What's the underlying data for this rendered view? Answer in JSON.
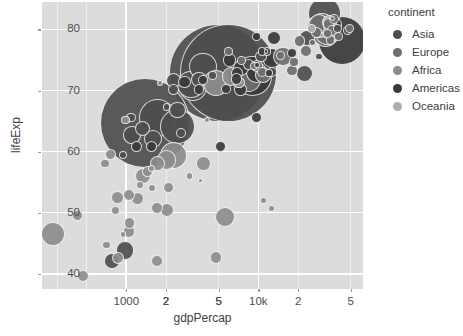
{
  "axes": {
    "xlabel": "gdpPercap",
    "ylabel": "lifeExp",
    "caption": "",
    "y_ticks": [
      "40",
      "50",
      "60",
      "70",
      "80"
    ],
    "x_ticks": [
      "2",
      "5",
      "1000",
      "2",
      "5",
      "10k",
      "2",
      "5"
    ]
  },
  "legend": {
    "title": "continent",
    "items": [
      {
        "label": "Asia",
        "color": "#4e4e4e"
      },
      {
        "label": "Europe",
        "color": "#6e6e6e"
      },
      {
        "label": "Africa",
        "color": "#8d8d8d"
      },
      {
        "label": "Americas",
        "color": "#3a3a3a"
      },
      {
        "label": "Oceania",
        "color": "#aeaeae"
      }
    ]
  },
  "chart_data": {
    "type": "scatter",
    "title": "",
    "xlabel": "gdpPercap",
    "ylabel": "lifeExp",
    "xscale": "log",
    "yscale": "linear",
    "xlim": [
      230,
      62000
    ],
    "ylim": [
      37.5,
      84.5
    ],
    "grid": true,
    "legend_position": "right",
    "legend_title": "continent",
    "size_encoding": "pop",
    "color_encoding": "continent",
    "x_tick_values": [
      2000,
      5000,
      1000,
      2000,
      5000,
      10000,
      20000,
      50000
    ],
    "x_tick_labels": [
      "2",
      "5",
      "1000",
      "2",
      "5",
      "10k",
      "2",
      "5"
    ],
    "y_tick_values": [
      40,
      50,
      60,
      70,
      80
    ],
    "y_tick_labels": [
      "40",
      "50",
      "60",
      "70",
      "80"
    ],
    "series": [
      {
        "name": "Asia",
        "color": "#4e4e4e",
        "points": [
          {
            "x": 974,
            "y": 43.8,
            "size": 31.9
          },
          {
            "x": 1391,
            "y": 64.7,
            "size": 1110.0
          },
          {
            "x": 4959,
            "y": 72.9,
            "size": 1318.7
          },
          {
            "x": 2452,
            "y": 64.1,
            "size": 150.4
          },
          {
            "x": 3541,
            "y": 71.8,
            "size": 22.2
          },
          {
            "x": 11606,
            "y": 76.4,
            "size": 4.0
          },
          {
            "x": 31656,
            "y": 82.6,
            "size": 127.5
          },
          {
            "x": 4519,
            "y": 72.5,
            "size": 4.0
          },
          {
            "x": 1593,
            "y": 62.1,
            "size": 31.9
          },
          {
            "x": 23348,
            "y": 78.6,
            "size": 23.0
          },
          {
            "x": 47307,
            "y": 79.9,
            "size": 4.6
          },
          {
            "x": 3095,
            "y": 71.0,
            "size": 88.0
          },
          {
            "x": 2441,
            "y": 66.8,
            "size": 24.0
          },
          {
            "x": 28718,
            "y": 75.6,
            "size": 2.5
          },
          {
            "x": 12779,
            "y": 73.0,
            "size": 6.4
          },
          {
            "x": 944,
            "y": 59.5,
            "size": 3.2
          },
          {
            "x": 1714,
            "y": 65.5,
            "size": 169.0
          },
          {
            "x": 3190,
            "y": 70.6,
            "size": 91.0
          },
          {
            "x": 1091,
            "y": 65.6,
            "size": 5.9
          },
          {
            "x": 22316,
            "y": 72.8,
            "size": 27.6
          },
          {
            "x": 2280,
            "y": 71.7,
            "size": 20.4
          },
          {
            "x": 1107,
            "y": 62.7,
            "size": 28.9
          },
          {
            "x": 2602,
            "y": 63.1,
            "size": 6.6
          },
          {
            "x": 39725,
            "y": 80.2,
            "size": 4.6
          },
          {
            "x": 2280,
            "y": 70.2,
            "size": 8.1
          },
          {
            "x": 5937,
            "y": 72.9,
            "size": 1318.0
          },
          {
            "x": 10461,
            "y": 75.6,
            "size": 9.0
          },
          {
            "x": 1327,
            "y": 63.8,
            "size": 20.0
          },
          {
            "x": 3822,
            "y": 73.9,
            "size": 85.3
          },
          {
            "x": 2013,
            "y": 67.3,
            "size": 2.1
          },
          {
            "x": 780,
            "y": 42.1,
            "size": 22.2
          },
          {
            "x": 8458,
            "y": 74.2,
            "size": 8.9
          }
        ]
      },
      {
        "name": "Europe",
        "color": "#6e6e6e",
        "points": [
          {
            "x": 5937,
            "y": 76.4,
            "size": 3.6
          },
          {
            "x": 36126,
            "y": 79.8,
            "size": 8.2
          },
          {
            "x": 33693,
            "y": 79.4,
            "size": 10.4
          },
          {
            "x": 7446,
            "y": 74.9,
            "size": 3.9
          },
          {
            "x": 10681,
            "y": 73.0,
            "size": 7.3
          },
          {
            "x": 14619,
            "y": 75.7,
            "size": 4.5
          },
          {
            "x": 22833,
            "y": 76.5,
            "size": 10.2
          },
          {
            "x": 35278,
            "y": 78.3,
            "size": 5.5
          },
          {
            "x": 33207,
            "y": 79.3,
            "size": 5.2
          },
          {
            "x": 30470,
            "y": 80.7,
            "size": 61.1
          },
          {
            "x": 32170,
            "y": 79.4,
            "size": 82.4
          },
          {
            "x": 27538,
            "y": 79.5,
            "size": 10.7
          },
          {
            "x": 18009,
            "y": 73.3,
            "size": 10.0
          },
          {
            "x": 36180,
            "y": 81.8,
            "size": 0.3
          },
          {
            "x": 40676,
            "y": 78.9,
            "size": 4.1
          },
          {
            "x": 28570,
            "y": 80.5,
            "size": 58.1
          },
          {
            "x": 9254,
            "y": 74.0,
            "size": 3.6
          },
          {
            "x": 36798,
            "y": 79.3,
            "size": 16.6
          },
          {
            "x": 49357,
            "y": 80.2,
            "size": 4.6
          },
          {
            "x": 15390,
            "y": 75.6,
            "size": 38.5
          },
          {
            "x": 20510,
            "y": 78.1,
            "size": 10.7
          },
          {
            "x": 10808,
            "y": 72.5,
            "size": 22.3
          },
          {
            "x": 9787,
            "y": 74.0,
            "size": 10.1
          },
          {
            "x": 18678,
            "y": 74.7,
            "size": 5.4
          },
          {
            "x": 25768,
            "y": 77.9,
            "size": 2.0
          },
          {
            "x": 28821,
            "y": 80.9,
            "size": 44.0
          },
          {
            "x": 33860,
            "y": 80.9,
            "size": 9.0
          },
          {
            "x": 37506,
            "y": 81.7,
            "size": 7.6
          },
          {
            "x": 8458,
            "y": 71.8,
            "size": 71.2
          },
          {
            "x": 33203,
            "y": 79.4,
            "size": 60.8
          }
        ]
      },
      {
        "name": "Africa",
        "color": "#8d8d8d",
        "points": [
          {
            "x": 6223,
            "y": 72.3,
            "size": 33.3
          },
          {
            "x": 4797,
            "y": 42.7,
            "size": 12.4
          },
          {
            "x": 1441,
            "y": 56.7,
            "size": 8.1
          },
          {
            "x": 12570,
            "y": 50.7,
            "size": 1.6
          },
          {
            "x": 1217,
            "y": 52.3,
            "size": 14.3
          },
          {
            "x": 430,
            "y": 49.6,
            "size": 8.4
          },
          {
            "x": 2042,
            "y": 50.4,
            "size": 17.7
          },
          {
            "x": 706,
            "y": 44.7,
            "size": 4.4
          },
          {
            "x": 1704,
            "y": 50.7,
            "size": 10.7
          },
          {
            "x": 986,
            "y": 65.2,
            "size": 3.8
          },
          {
            "x": 277,
            "y": 46.5,
            "size": 64.6
          },
          {
            "x": 3633,
            "y": 55.3,
            "size": 0.5
          },
          {
            "x": 4797,
            "y": 71.3,
            "size": 75.0
          },
          {
            "x": 10956,
            "y": 52.0,
            "size": 1.5
          },
          {
            "x": 2277,
            "y": 59.4,
            "size": 83.0
          },
          {
            "x": 690,
            "y": 58.0,
            "size": 4.9
          },
          {
            "x": 943,
            "y": 46.4,
            "size": 1.5
          },
          {
            "x": 1327,
            "y": 56.0,
            "size": 23.5
          },
          {
            "x": 759,
            "y": 59.5,
            "size": 9.1
          },
          {
            "x": 862,
            "y": 42.6,
            "size": 12.3
          },
          {
            "x": 1569,
            "y": 54.1,
            "size": 3.5
          },
          {
            "x": 1544,
            "y": 57.3,
            "size": 2.0
          },
          {
            "x": 1713,
            "y": 58.0,
            "size": 19.2
          },
          {
            "x": 863,
            "y": 52.5,
            "size": 13.3
          },
          {
            "x": 1044,
            "y": 46.9,
            "size": 12.0
          },
          {
            "x": 1803,
            "y": 71.2,
            "size": 1.3
          },
          {
            "x": 3820,
            "y": 58.0,
            "size": 19.0
          },
          {
            "x": 823,
            "y": 50.4,
            "size": 4.5
          },
          {
            "x": 4072,
            "y": 65.2,
            "size": 1.1
          },
          {
            "x": 2082,
            "y": 54.1,
            "size": 9.0
          },
          {
            "x": 5581,
            "y": 49.3,
            "size": 43.0
          },
          {
            "x": 2013,
            "y": 58.6,
            "size": 38.1
          },
          {
            "x": 1056,
            "y": 48.3,
            "size": 9.9
          },
          {
            "x": 1271,
            "y": 54.5,
            "size": 4.0
          },
          {
            "x": 1044,
            "y": 52.9,
            "size": 11.4
          },
          {
            "x": 7093,
            "y": 71.3,
            "size": 10.2
          },
          {
            "x": 1704,
            "y": 42.1,
            "size": 11.7
          },
          {
            "x": 3025,
            "y": 56.0,
            "size": 2.1
          },
          {
            "x": 469,
            "y": 39.6,
            "size": 12.3
          }
        ]
      },
      {
        "name": "Americas",
        "color": "#3a3a3a",
        "points": [
          {
            "x": 12779,
            "y": 75.3,
            "size": 40.3
          },
          {
            "x": 9666,
            "y": 65.6,
            "size": 9.1
          },
          {
            "x": 9066,
            "y": 72.4,
            "size": 190.0
          },
          {
            "x": 36319,
            "y": 80.7,
            "size": 33.4
          },
          {
            "x": 13172,
            "y": 78.6,
            "size": 16.3
          },
          {
            "x": 9645,
            "y": 72.9,
            "size": 44.2
          },
          {
            "x": 9645,
            "y": 78.8,
            "size": 4.1
          },
          {
            "x": 6873,
            "y": 72.9,
            "size": 11.4
          },
          {
            "x": 6025,
            "y": 75.0,
            "size": 13.7
          },
          {
            "x": 6873,
            "y": 71.9,
            "size": 9.1
          },
          {
            "x": 5728,
            "y": 70.3,
            "size": 6.9
          },
          {
            "x": 5186,
            "y": 60.9,
            "size": 8.5
          },
          {
            "x": 7320,
            "y": 70.2,
            "size": 12.6
          },
          {
            "x": 1201,
            "y": 60.9,
            "size": 8.5
          },
          {
            "x": 3548,
            "y": 70.2,
            "size": 7.5
          },
          {
            "x": 11978,
            "y": 72.9,
            "size": 2.8
          },
          {
            "x": 42952,
            "y": 78.2,
            "size": 301.1
          },
          {
            "x": 10611,
            "y": 76.4,
            "size": 3.4
          },
          {
            "x": 7409,
            "y": 73.7,
            "size": 26.1
          },
          {
            "x": 11416,
            "y": 76.4,
            "size": 0.2
          },
          {
            "x": 9809,
            "y": 74.2,
            "size": 1.3
          },
          {
            "x": 18009,
            "y": 76.2,
            "size": 6.0
          },
          {
            "x": 3822,
            "y": 71.8,
            "size": 6.3
          },
          {
            "x": 2749,
            "y": 71.4,
            "size": 12.8
          },
          {
            "x": 1544,
            "y": 60.9,
            "size": 8.5
          }
        ]
      },
      {
        "name": "Oceania",
        "color": "#aeaeae",
        "points": [
          {
            "x": 34435,
            "y": 81.2,
            "size": 20.4
          },
          {
            "x": 25185,
            "y": 80.2,
            "size": 4.1
          }
        ]
      }
    ]
  }
}
